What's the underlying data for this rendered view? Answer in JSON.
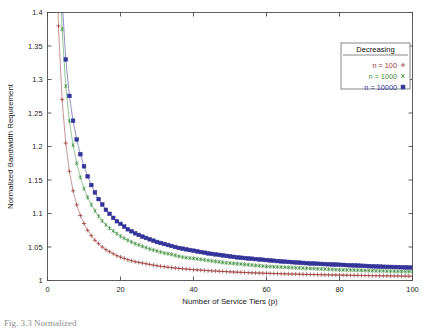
{
  "chart_data": {
    "type": "line",
    "title": "",
    "xlabel": "Number of Service Tiers (p)",
    "ylabel": "Normalized Bandwidth Requirement",
    "xlim": [
      0,
      100
    ],
    "ylim": [
      1,
      1.4
    ],
    "xticks": [
      0,
      20,
      40,
      60,
      80,
      100
    ],
    "yticks": [
      1,
      1.05,
      1.1,
      1.15,
      1.2,
      1.25,
      1.3,
      1.35,
      1.4
    ],
    "xtick_labels": [
      "0",
      "20",
      "40",
      "60",
      "80",
      "100"
    ],
    "ytick_labels": [
      "1",
      "1.05",
      "1.1",
      "1.15",
      "1.2",
      "1.25",
      "1.3",
      "1.35",
      "1.4"
    ],
    "grid": false,
    "legend_position": "upper-right",
    "legend_title": "Decreasing",
    "x": [
      2,
      3,
      4,
      5,
      6,
      7,
      8,
      9,
      10,
      11,
      12,
      13,
      14,
      15,
      16,
      17,
      18,
      19,
      20,
      22,
      24,
      26,
      28,
      30,
      32,
      34,
      36,
      38,
      40,
      44,
      48,
      52,
      56,
      60,
      64,
      68,
      72,
      76,
      80,
      84,
      88,
      92,
      96,
      100
    ],
    "series": [
      {
        "name": "n = 100",
        "marker": "plus",
        "color": "#9b3a3a",
        "values": [
          1.62,
          1.38,
          1.27,
          1.205,
          1.163,
          1.134,
          1.113,
          1.097,
          1.085,
          1.075,
          1.067,
          1.06,
          1.055,
          1.05,
          1.046,
          1.043,
          1.04,
          1.037,
          1.035,
          1.031,
          1.028,
          1.026,
          1.024,
          1.022,
          1.0205,
          1.0192,
          1.018,
          1.0171,
          1.0162,
          1.0147,
          1.0135,
          1.0124,
          1.0115,
          1.0108,
          1.0101,
          1.0095,
          1.009,
          1.0085,
          1.0081,
          1.0077,
          1.0073,
          1.007,
          1.0067,
          1.0064
        ]
      },
      {
        "name": "n = 1000",
        "marker": "star",
        "color": "#3f8f3f",
        "values": [
          1.86,
          1.52,
          1.375,
          1.29,
          1.238,
          1.202,
          1.175,
          1.154,
          1.137,
          1.124,
          1.113,
          1.104,
          1.096,
          1.089,
          1.083,
          1.078,
          1.074,
          1.07,
          1.066,
          1.06,
          1.055,
          1.051,
          1.047,
          1.044,
          1.041,
          1.039,
          1.036,
          1.034,
          1.033,
          1.03,
          1.027,
          1.025,
          1.023,
          1.021,
          1.02,
          1.019,
          1.018,
          1.017,
          1.016,
          1.0155,
          1.0148,
          1.0142,
          1.0136,
          1.0131
        ]
      },
      {
        "name": "n = 10000",
        "marker": "square",
        "color": "#333399",
        "values": [
          1.95,
          1.58,
          1.42,
          1.33,
          1.2755,
          1.2385,
          1.2105,
          1.1885,
          1.1705,
          1.1555,
          1.1425,
          1.1315,
          1.1215,
          1.1135,
          1.1055,
          1.0995,
          1.0935,
          1.0885,
          1.0845,
          1.0765,
          1.0705,
          1.0655,
          1.0615,
          1.0575,
          1.0545,
          1.0515,
          1.0485,
          1.0465,
          1.0445,
          1.0405,
          1.0375,
          1.0345,
          1.0325,
          1.0305,
          1.0285,
          1.027,
          1.0255,
          1.0245,
          1.0235,
          1.0225,
          1.0215,
          1.0205,
          1.02,
          1.0192
        ]
      }
    ]
  },
  "legend": {
    "title": "Decreasing",
    "entries": [
      {
        "label": "n = 100",
        "marker": "plus",
        "color": "#9b3a3a"
      },
      {
        "label": "n = 1000",
        "marker": "star",
        "color": "#3f8f3f"
      },
      {
        "label": "n = 10000",
        "marker": "square",
        "color": "#333399"
      }
    ]
  },
  "caption": {
    "text": "Fig. 3.3 Normalized"
  }
}
